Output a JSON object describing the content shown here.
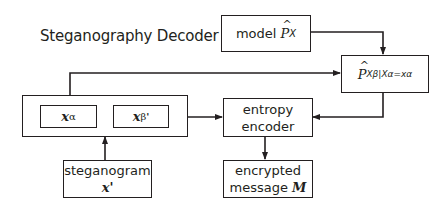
{
  "title": "Steganography Decoder",
  "blocks": {
    "model": {
      "label": "model",
      "symbol": "P",
      "subscript": "X"
    },
    "conditional": {
      "symbol": "P",
      "subscript": "Xβ|Xα=xα"
    },
    "container": {
      "x_alpha": {
        "symbol": "x",
        "subscript": "α"
      },
      "x_beta": {
        "symbol": "x",
        "subscript": "β",
        "prime": "'"
      }
    },
    "entropy_encoder": {
      "line1": "entropy",
      "line2": "encoder"
    },
    "steganogram": {
      "label": "steganogram",
      "symbol": "x'"
    },
    "encrypted_message": {
      "line1": "encrypted",
      "line2": "message",
      "symbol": "M"
    }
  },
  "colors": {
    "line": "#231f20",
    "background": "#ffffff"
  }
}
